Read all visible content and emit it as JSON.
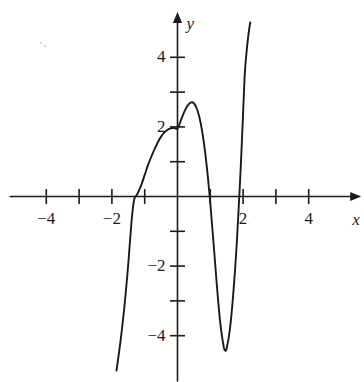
{
  "figure": {
    "title": "",
    "background_color": "#ffffff",
    "curve_color": "#1a1a1a",
    "axis_color": "#1a1a1a",
    "width": 364,
    "height": 382
  },
  "axes": {
    "x_axis_label": "x",
    "y_axis_label": "y",
    "x_ticks": [
      {
        "value": -4,
        "label": "−4",
        "show_label": true
      },
      {
        "value": -3,
        "label": "",
        "show_label": false
      },
      {
        "value": -2,
        "label": "−2",
        "show_label": true
      },
      {
        "value": -1,
        "label": "",
        "show_label": false
      },
      {
        "value": 1,
        "label": "",
        "show_label": false
      },
      {
        "value": 2,
        "label": "2",
        "show_label": true
      },
      {
        "value": 3,
        "label": "",
        "show_label": false
      },
      {
        "value": 4,
        "label": "4",
        "show_label": true
      }
    ],
    "y_ticks": [
      {
        "value": 4,
        "label": "4",
        "show_label": true
      },
      {
        "value": 3,
        "label": "",
        "show_label": false
      },
      {
        "value": 2,
        "label": "2",
        "show_label": true
      },
      {
        "value": 1,
        "label": "",
        "show_label": false
      },
      {
        "value": -1,
        "label": "",
        "show_label": false
      },
      {
        "value": -2,
        "label": "−2",
        "show_label": true
      },
      {
        "value": -3,
        "label": "",
        "show_label": false
      },
      {
        "value": -4,
        "label": "−4",
        "show_label": true
      }
    ]
  },
  "chart_data": {
    "type": "line",
    "title": "",
    "xlabel": "x",
    "ylabel": "y",
    "xlim": [
      -5.1,
      5.6
    ],
    "ylim": [
      -5.3,
      5.3
    ],
    "grid": false,
    "legend": false,
    "axis_style": "arrows-on-positive-ends",
    "features": {
      "x_intercepts": [
        -1.3,
        0.92,
        2.03
      ],
      "y_intercept": 1.95,
      "local_maximum": {
        "x": 0.45,
        "y": 2.7
      },
      "local_minimum": {
        "x": 1.45,
        "y": -4.4
      },
      "inflection_flat_point": {
        "x": -1.3,
        "y": -0.02
      },
      "left_branch_end": {
        "x": -1.85,
        "y": -5.0
      },
      "right_branch_end": {
        "x": 2.22,
        "y": 5.0
      }
    },
    "series": [
      {
        "name": "curve",
        "x": [
          -1.86,
          -1.8,
          -1.74,
          -1.68,
          -1.62,
          -1.56,
          -1.5,
          -1.45,
          -1.41,
          -1.38,
          -1.35,
          -1.33,
          -1.31,
          -1.29,
          -1.26,
          -1.22,
          -1.17,
          -1.1,
          -1.0,
          -0.9,
          -0.8,
          -0.7,
          -0.6,
          -0.5,
          -0.4,
          -0.3,
          -0.2,
          -0.1,
          0.0,
          0.1,
          0.2,
          0.3,
          0.4,
          0.5,
          0.6,
          0.7,
          0.8,
          0.9,
          1.0,
          1.1,
          1.2,
          1.3,
          1.4,
          1.45,
          1.5,
          1.6,
          1.7,
          1.8,
          1.9,
          1.95,
          2.0,
          2.05,
          2.1,
          2.15,
          2.2,
          2.22
        ],
        "y": [
          -5.0,
          -4.6,
          -4.18,
          -3.7,
          -3.18,
          -2.58,
          -1.92,
          -1.3,
          -0.82,
          -0.5,
          -0.26,
          -0.13,
          -0.05,
          -0.01,
          0.02,
          0.08,
          0.18,
          0.34,
          0.62,
          0.9,
          1.14,
          1.36,
          1.56,
          1.72,
          1.84,
          1.92,
          1.96,
          1.97,
          1.95,
          2.18,
          2.42,
          2.6,
          2.7,
          2.68,
          2.5,
          2.14,
          1.58,
          0.8,
          -0.2,
          -1.35,
          -2.55,
          -3.6,
          -4.28,
          -4.42,
          -4.36,
          -3.8,
          -2.8,
          -1.45,
          0.3,
          1.3,
          2.4,
          3.5,
          4.1,
          4.55,
          4.9,
          5.0
        ]
      }
    ]
  },
  "artifacts": {
    "specks": [
      {
        "x": 40,
        "y": 42
      },
      {
        "x": 44,
        "y": 45
      }
    ]
  }
}
